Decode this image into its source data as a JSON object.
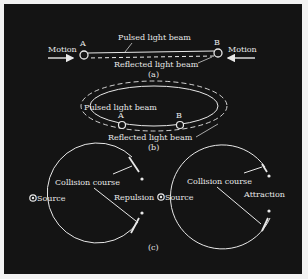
{
  "figure": {
    "panel_a": {
      "caption": "(a)",
      "point_a_label": "A",
      "point_b_label": "B",
      "motion_left_label": "Motion",
      "motion_right_label": "Motion",
      "pulsed_label": "Pulsed light beam",
      "reflected_label": "Reflected light beam"
    },
    "panel_b": {
      "caption": "(b)",
      "point_a_label": "A",
      "point_b_label": "B",
      "pulsed_label": "Pulsed light beam",
      "reflected_label": "Reflected light beam"
    },
    "panel_c": {
      "caption": "(c)",
      "left": {
        "source_label": "Source",
        "collision_label": "Collision course",
        "effect_label": "Repulsion"
      },
      "right": {
        "source_label": "Source",
        "collision_label": "Collision course",
        "effect_label": "Attraction"
      }
    },
    "colors": {
      "background": "#141414",
      "border": "#f2f2f2",
      "line": "#e8e8e8"
    }
  }
}
